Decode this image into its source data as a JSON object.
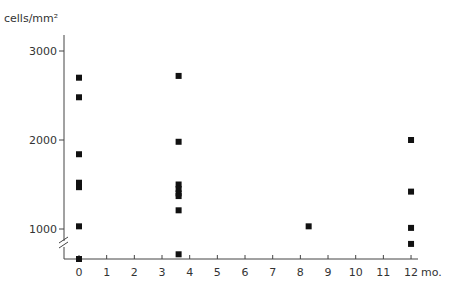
{
  "chart_data": {
    "type": "scatter",
    "title": "",
    "xlabel": "mo.",
    "ylabel": "cells/mm²",
    "x_ticks": [
      "0",
      "1",
      "2",
      "3",
      "4",
      "5",
      "6",
      "7",
      "8",
      "9",
      "10",
      "11",
      "12"
    ],
    "y_ticks": [
      "1000",
      "2000",
      "3000"
    ],
    "xlim": [
      0,
      12
    ],
    "ylim": [
      650,
      3000
    ],
    "axis_break": true,
    "grid": false,
    "legend": null,
    "series": [
      {
        "name": "cell density",
        "points": [
          {
            "x": 0,
            "y": 2700
          },
          {
            "x": 0,
            "y": 2480
          },
          {
            "x": 0,
            "y": 1840
          },
          {
            "x": 0,
            "y": 1520
          },
          {
            "x": 0,
            "y": 1470
          },
          {
            "x": 0,
            "y": 1030
          },
          {
            "x": 0,
            "y": 650
          },
          {
            "x": 3.6,
            "y": 2720
          },
          {
            "x": 3.6,
            "y": 1980
          },
          {
            "x": 3.6,
            "y": 1500
          },
          {
            "x": 3.6,
            "y": 1450
          },
          {
            "x": 3.6,
            "y": 1400
          },
          {
            "x": 3.6,
            "y": 1370
          },
          {
            "x": 3.6,
            "y": 1210
          },
          {
            "x": 3.6,
            "y": 700
          },
          {
            "x": 8.3,
            "y": 1030
          },
          {
            "x": 12,
            "y": 2000
          },
          {
            "x": 12,
            "y": 1420
          },
          {
            "x": 12,
            "y": 980
          },
          {
            "x": 12,
            "y": 810
          }
        ]
      }
    ]
  }
}
